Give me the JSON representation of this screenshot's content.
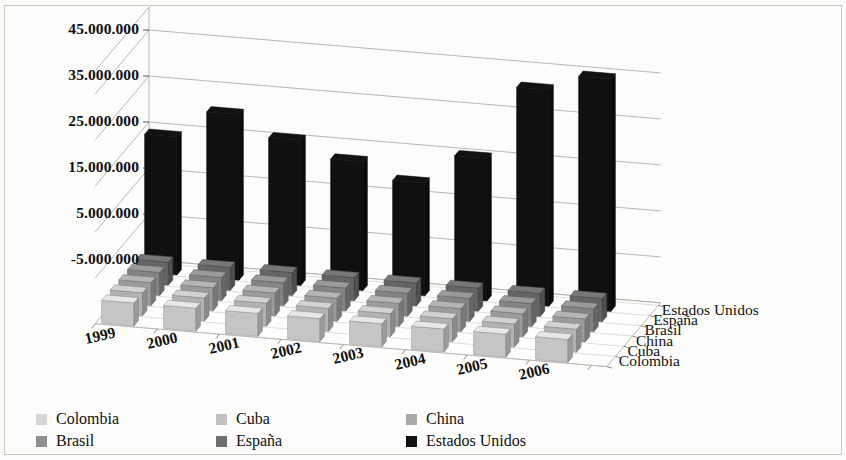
{
  "chart_data": {
    "type": "bar",
    "title": "",
    "subtitle": "",
    "xlabel": "",
    "ylabel": "",
    "grid": true,
    "legend_position": "bottom-left",
    "projection": "3d",
    "categories": [
      "1999",
      "2000",
      "2001",
      "2002",
      "2003",
      "2004",
      "2005",
      "2006"
    ],
    "depth_categories": [
      "Colombia",
      "Cuba",
      "China",
      "Brasil",
      "España",
      "Estados Unidos"
    ],
    "ytick_labels": [
      "-5.000.000",
      "5.000.000",
      "15.000.000",
      "25.000.000",
      "35.000.000",
      "45.000.000"
    ],
    "ytick_values": [
      -5000000,
      5000000,
      15000000,
      25000000,
      35000000,
      45000000
    ],
    "ylim": [
      -5000000,
      50000000
    ],
    "series": [
      {
        "name": "Colombia",
        "color": "#d6d6d6",
        "values": [
          0,
          0,
          0,
          0,
          0,
          0,
          0,
          0
        ]
      },
      {
        "name": "Cuba",
        "color": "#c2c2c2",
        "values": [
          0,
          0,
          0,
          0,
          0,
          0,
          0,
          0
        ]
      },
      {
        "name": "China",
        "color": "#a8a8a8",
        "values": [
          0,
          0,
          0,
          0,
          0,
          0,
          0,
          0
        ]
      },
      {
        "name": "Brasil",
        "color": "#8f8f8f",
        "values": [
          0,
          0,
          0,
          0,
          0,
          0,
          0,
          0
        ]
      },
      {
        "name": "España",
        "color": "#6e6e6e",
        "values": [
          0,
          0,
          0,
          0,
          0,
          0,
          0,
          0
        ]
      },
      {
        "name": "Estados Unidos",
        "color": "#111111",
        "values": [
          25000000,
          31000000,
          26500000,
          23000000,
          19500000,
          26000000,
          42000000,
          45500000
        ]
      }
    ]
  },
  "axes": {
    "y_ticks": [
      {
        "label": "45.000.000"
      },
      {
        "label": "35.000.000"
      },
      {
        "label": "25.000.000"
      },
      {
        "label": "15.000.000"
      },
      {
        "label": "5.000.000"
      },
      {
        "label": "-5.000.000"
      }
    ],
    "x_ticks": [
      {
        "label": "1999"
      },
      {
        "label": "2000"
      },
      {
        "label": "2001"
      },
      {
        "label": "2002"
      },
      {
        "label": "2003"
      },
      {
        "label": "2004"
      },
      {
        "label": "2005"
      },
      {
        "label": "2006"
      }
    ],
    "z_ticks": [
      {
        "label": "Estados Unidos"
      },
      {
        "label": "España"
      },
      {
        "label": "Brasil"
      },
      {
        "label": "China"
      },
      {
        "label": "Cuba"
      },
      {
        "label": "Colombia"
      }
    ]
  },
  "legend": {
    "rows": [
      [
        {
          "label": "Colombia",
          "color": "#d6d6d6"
        },
        {
          "label": "Cuba",
          "color": "#c2c2c2"
        },
        {
          "label": "China",
          "color": "#a8a8a8"
        }
      ],
      [
        {
          "label": "Brasil",
          "color": "#8f8f8f"
        },
        {
          "label": "España",
          "color": "#6e6e6e"
        },
        {
          "label": "Estados Unidos",
          "color": "#111111"
        }
      ]
    ]
  }
}
